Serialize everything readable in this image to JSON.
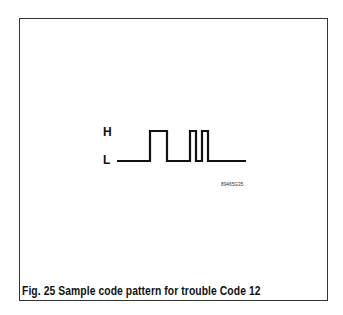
{
  "figure": {
    "caption": "Fig. 25 Sample code pattern for trouble Code 12",
    "high_label": "H",
    "low_label": "L",
    "image_code": "89465G35",
    "waveform": {
      "pattern": "1 long pulse, pause, 2 short pulses",
      "code": 12
    }
  }
}
